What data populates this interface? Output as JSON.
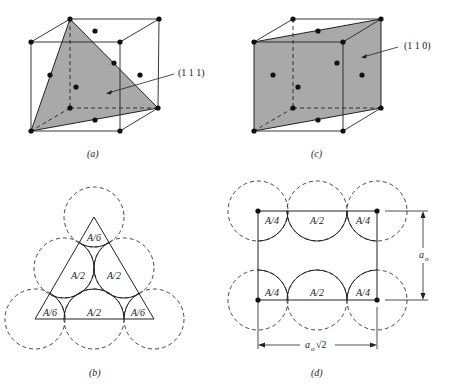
{
  "colors": {
    "plane_fill": "#a9a9a9",
    "line": "#222222",
    "atom": "#111111"
  },
  "panels": {
    "a": {
      "caption": "(a)",
      "plane_label": "(1 1 1)"
    },
    "c": {
      "caption": "(c)",
      "plane_label": "(1 1 0)"
    },
    "b": {
      "caption": "(b)",
      "labels": [
        "A/6",
        "A/2",
        "A/2",
        "A/6",
        "A/2",
        "A/6"
      ]
    },
    "d": {
      "caption": "(d)",
      "labels_top": [
        "A/4",
        "A/2",
        "A/4"
      ],
      "labels_bottom": [
        "A/4",
        "A/2",
        "A/4"
      ],
      "dim_vertical": "a",
      "dim_vertical_sub": "o",
      "dim_horizontal": "a",
      "dim_horizontal_sub": "o",
      "dim_horizontal_root": "√2"
    }
  }
}
